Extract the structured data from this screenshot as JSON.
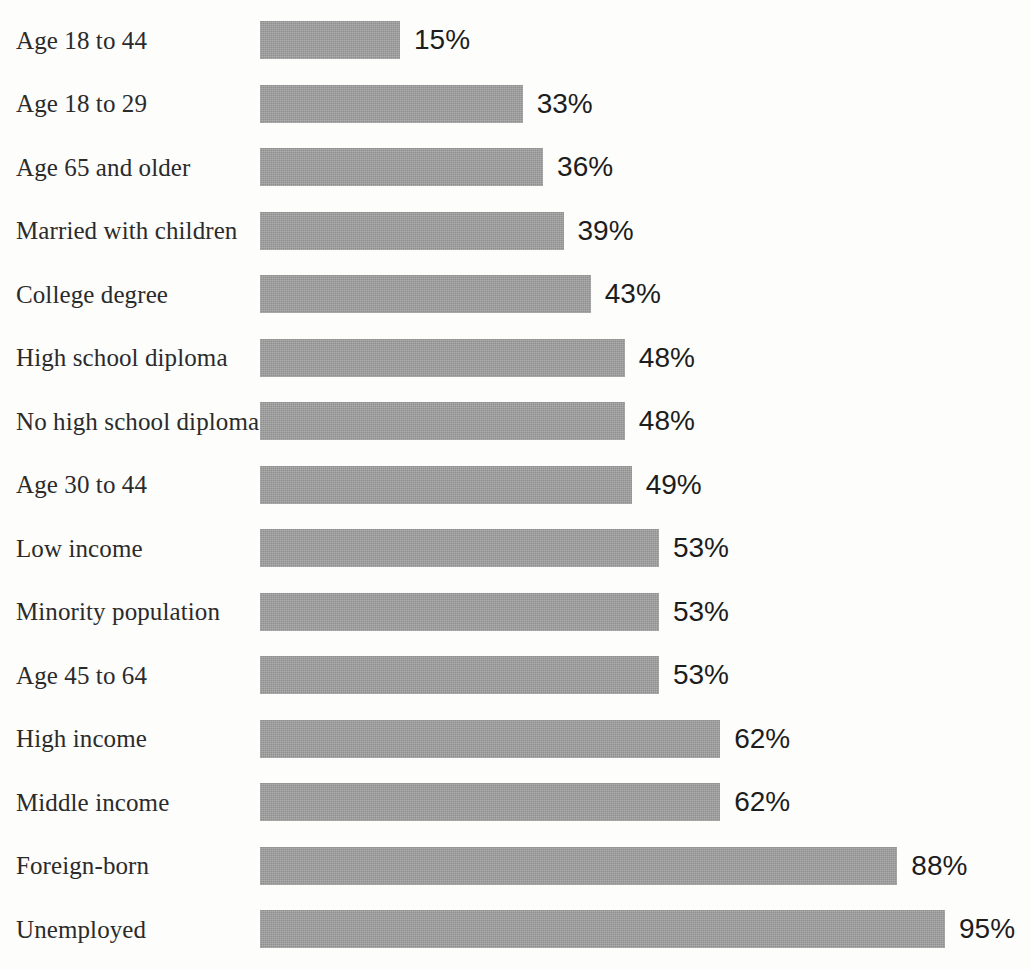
{
  "chart_data": {
    "type": "bar",
    "orientation": "horizontal",
    "title": "",
    "subtitle": "",
    "xlabel": "",
    "ylabel": "",
    "grid": false,
    "legend": null,
    "value_suffix": "%",
    "xlim": [
      0,
      100
    ],
    "categories": [
      "Age 18 to 44",
      "Age 18 to 29",
      "Age 65 and older",
      "Married with children",
      "College degree",
      "High school diploma",
      "No high school diploma",
      "Age 30 to 44",
      "Low income",
      "Minority population",
      "Age 45 to 64",
      "High income",
      "Middle income",
      "Foreign-born",
      "Unemployed"
    ],
    "values": [
      15,
      33,
      36,
      39,
      43,
      48,
      48,
      49,
      53,
      53,
      53,
      62,
      62,
      88,
      95
    ],
    "value_labels": [
      "15%",
      "33%",
      "36%",
      "39%",
      "43%",
      "48%",
      "48%",
      "49%",
      "53%",
      "53%",
      "53%",
      "62%",
      "62%",
      "88%",
      "95%"
    ],
    "colors": {
      "bar_fill": "#9b9b9b",
      "label_text": "#2b2b2b",
      "value_text": "#1d1d1d",
      "background": "#fdfdfc"
    }
  },
  "rows": [
    {
      "label": "Age 18 to 44",
      "value": 15,
      "value_label": "15%"
    },
    {
      "label": "Age 18 to 29",
      "value": 33,
      "value_label": "33%"
    },
    {
      "label": "Age 65 and older",
      "value": 36,
      "value_label": "36%"
    },
    {
      "label": "Married with children",
      "value": 39,
      "value_label": "39%"
    },
    {
      "label": "College degree",
      "value": 43,
      "value_label": "43%"
    },
    {
      "label": "High school diploma",
      "value": 48,
      "value_label": "48%"
    },
    {
      "label": "No high school diploma",
      "value": 48,
      "value_label": "48%"
    },
    {
      "label": "Age 30 to 44",
      "value": 49,
      "value_label": "49%"
    },
    {
      "label": "Low income",
      "value": 53,
      "value_label": "53%"
    },
    {
      "label": "Minority population",
      "value": 53,
      "value_label": "53%"
    },
    {
      "label": "Age 45 to 64",
      "value": 53,
      "value_label": "53%"
    },
    {
      "label": "High income",
      "value": 62,
      "value_label": "62%"
    },
    {
      "label": "Middle income",
      "value": 62,
      "value_label": "62%"
    },
    {
      "label": "Foreign-born",
      "value": 88,
      "value_label": "88%"
    },
    {
      "label": "Unemployed",
      "value": 95,
      "value_label": "95%"
    }
  ],
  "layout": {
    "bar_origin_x": 260,
    "bar_height": 38,
    "row_pitch": 63.5,
    "first_row_top": 8.5,
    "value_gap": 14,
    "width_at_min": 140,
    "min_value": 15,
    "px_per_percent": 6.8125
  }
}
